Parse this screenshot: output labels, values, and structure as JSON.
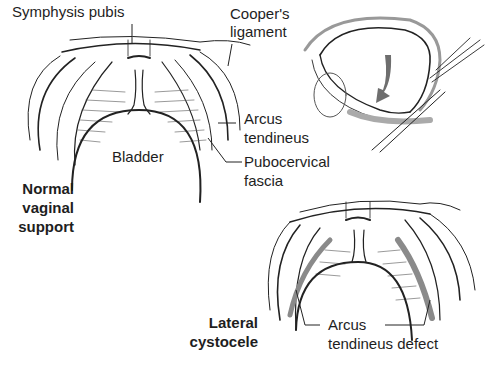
{
  "figure": {
    "panels": [
      {
        "id": "normal",
        "title_lines": [
          "Normal",
          "vaginal",
          "support"
        ],
        "labels": {
          "symphysis": "Symphysis pubis",
          "cooper_1": "Cooper's",
          "cooper_2": "ligament",
          "arcus_1": "Arcus",
          "arcus_2": "tendineus",
          "bladder": "Bladder",
          "pubocervical_1": "Pubocervical",
          "pubocervical_2": "fascia"
        }
      },
      {
        "id": "lateral-view",
        "description": "Sagittal bladder view with downward arrow"
      },
      {
        "id": "cystocele",
        "title_lines": [
          "Lateral",
          "cystocele"
        ],
        "labels": {
          "arcus_1": "Arcus",
          "arcus_2": "tendineus defect"
        }
      }
    ],
    "colors": {
      "ink": "#222222",
      "shade": "#8a8a8a",
      "arrow": "#6e6e6e"
    }
  }
}
